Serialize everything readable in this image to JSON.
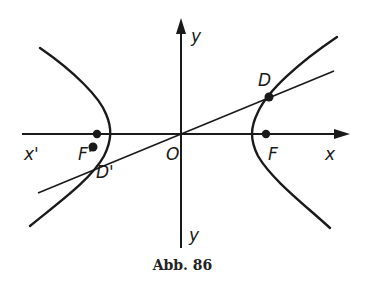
{
  "figure": {
    "caption": "Abb. 86",
    "colors": {
      "ink": "#1a1a1a",
      "background": "#ffffff"
    },
    "axes": {
      "x_label": "x",
      "x_neg_label": "x'",
      "y_label": "y",
      "y_neg_label": "y",
      "origin_label": "O"
    },
    "points": {
      "F": "F",
      "F_prime": "F'",
      "D": "D",
      "D_prime": "D'"
    },
    "elements": [
      "hyperbola-left-branch",
      "hyperbola-right-branch",
      "line-through-origin-D-D'",
      "x-axis",
      "y-axis"
    ]
  }
}
